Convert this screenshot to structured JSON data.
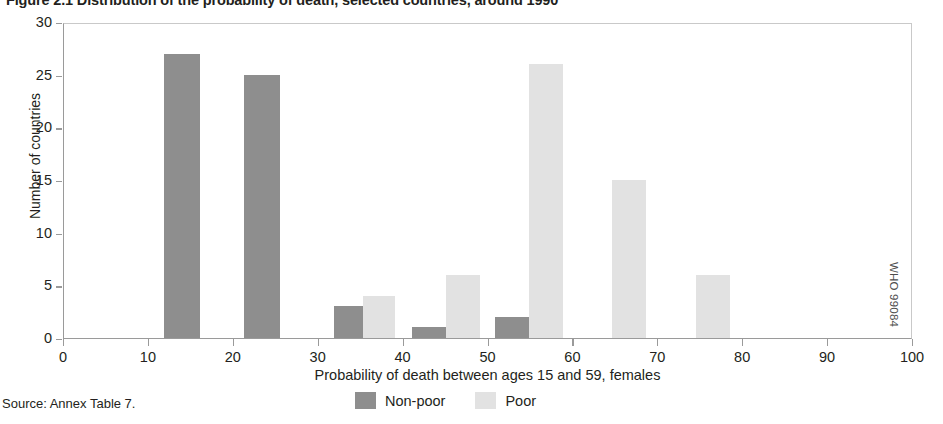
{
  "figure": {
    "title": "Figure 2.1 Distribution of the probability of death, selected countries, around 1990",
    "source_note": "Source: Annex Table 7.",
    "credit_code": "WHO 99084"
  },
  "chart_data": {
    "type": "bar",
    "title": "Figure 2.1 Distribution of the probability of death, selected countries, around 1990",
    "xlabel": "Probability of death between ages 15 and 59, females",
    "ylabel": "Number of countries",
    "xlim": [
      0,
      100
    ],
    "ylim": [
      0,
      30
    ],
    "xticks": [
      "0",
      "10",
      "20",
      "30",
      "40",
      "50",
      "60",
      "70",
      "80",
      "90",
      "100"
    ],
    "yticks": [
      "0",
      "5",
      "10",
      "15",
      "20",
      "25",
      "30"
    ],
    "grid": false,
    "legend_position": "bottom-center",
    "series": [
      {
        "name": "Non-poor",
        "color": "#8e8e8e",
        "bars": [
          {
            "x_start": 11.8,
            "x_end": 16.0,
            "value": 27
          },
          {
            "x_start": 21.2,
            "x_end": 25.4,
            "value": 25
          },
          {
            "x_start": 31.8,
            "x_end": 35.2,
            "value": 3
          },
          {
            "x_start": 41.0,
            "x_end": 45.0,
            "value": 1
          },
          {
            "x_start": 50.8,
            "x_end": 54.8,
            "value": 2
          }
        ]
      },
      {
        "name": "Poor",
        "color": "#e2e2e2",
        "bars": [
          {
            "x_start": 35.2,
            "x_end": 39.0,
            "value": 4
          },
          {
            "x_start": 45.0,
            "x_end": 49.0,
            "value": 6
          },
          {
            "x_start": 54.8,
            "x_end": 58.8,
            "value": 26
          },
          {
            "x_start": 64.6,
            "x_end": 68.6,
            "value": 15
          },
          {
            "x_start": 74.4,
            "x_end": 78.4,
            "value": 6
          }
        ]
      }
    ],
    "legend": [
      {
        "label": "Non-poor",
        "color": "#8e8e8e"
      },
      {
        "label": "Poor",
        "color": "#e2e2e2"
      }
    ]
  }
}
